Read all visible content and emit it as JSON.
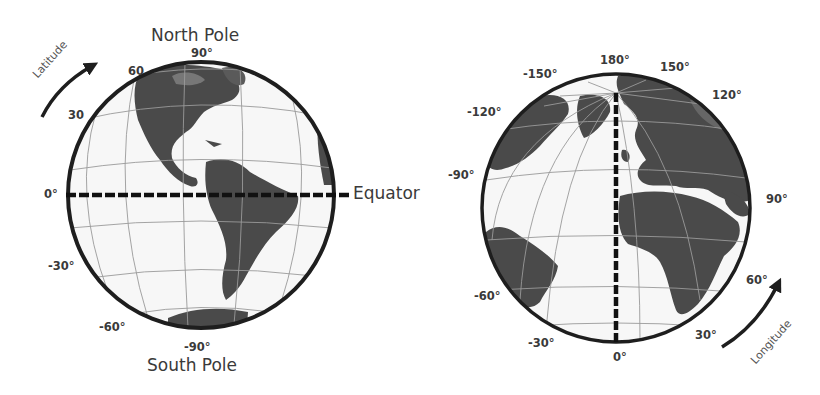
{
  "colors": {
    "land": "#4a4a4a",
    "ocean": "#f7f7f7",
    "graticule": "#9a9a9a",
    "outline": "#1e1e1e",
    "text": "#3a3a3a",
    "dashed_line": "#111111"
  },
  "latitude_globe": {
    "title_top": "North Pole",
    "title_bottom": "South Pole",
    "equator_label": "Equator",
    "axis_word": "Latitude",
    "ticks": [
      "90°",
      "60",
      "30",
      "0°",
      "-30°",
      "-60°",
      "-90°"
    ]
  },
  "longitude_globe": {
    "axis_word": "Longitude",
    "ticks": [
      "180°",
      "150°",
      "-150°",
      "120°",
      "-120°",
      "-90°",
      "90°",
      "60°",
      "-60°",
      "30°",
      "-30°",
      "0°"
    ]
  }
}
